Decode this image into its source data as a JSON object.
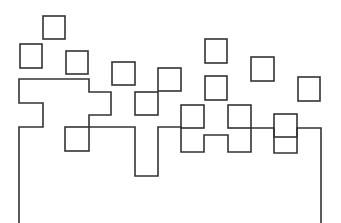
{
  "diagram": {
    "width": 341,
    "height": 223,
    "background": "#ffffff",
    "stroke_color": "#333333",
    "stroke_width": 1.6,
    "outline_path": [
      [
        19,
        223
      ],
      [
        19,
        127
      ],
      [
        43,
        127
      ],
      [
        43,
        103
      ],
      [
        19,
        103
      ],
      [
        19,
        79
      ],
      [
        89,
        79
      ],
      [
        89,
        92
      ],
      [
        111,
        92
      ],
      [
        111,
        115
      ],
      [
        89,
        115
      ],
      [
        89,
        127
      ],
      [
        135,
        127
      ],
      [
        135,
        176
      ],
      [
        158,
        176
      ],
      [
        158,
        127
      ],
      [
        181,
        127
      ],
      [
        181,
        152
      ],
      [
        204,
        152
      ],
      [
        204,
        135
      ],
      [
        228,
        135
      ],
      [
        228,
        152
      ],
      [
        251,
        152
      ],
      [
        251,
        128
      ],
      [
        274,
        128
      ],
      [
        274,
        153
      ],
      [
        297,
        153
      ],
      [
        297,
        128
      ],
      [
        321,
        128
      ],
      [
        321,
        223
      ]
    ],
    "squares": [
      {
        "x": 43,
        "y": 16,
        "w": 22,
        "h": 23
      },
      {
        "x": 20,
        "y": 44,
        "w": 22,
        "h": 24
      },
      {
        "x": 66,
        "y": 51,
        "w": 22,
        "h": 23
      },
      {
        "x": 112,
        "y": 62,
        "w": 23,
        "h": 23
      },
      {
        "x": 158,
        "y": 68,
        "w": 23,
        "h": 23
      },
      {
        "x": 135,
        "y": 92,
        "w": 23,
        "h": 23
      },
      {
        "x": 65,
        "y": 127,
        "w": 24,
        "h": 24
      },
      {
        "x": 205,
        "y": 39,
        "w": 22,
        "h": 24
      },
      {
        "x": 251,
        "y": 57,
        "w": 23,
        "h": 24
      },
      {
        "x": 205,
        "y": 76,
        "w": 22,
        "h": 24
      },
      {
        "x": 298,
        "y": 77,
        "w": 22,
        "h": 24
      },
      {
        "x": 181,
        "y": 105,
        "w": 23,
        "h": 23
      },
      {
        "x": 228,
        "y": 105,
        "w": 23,
        "h": 23
      },
      {
        "x": 274,
        "y": 114,
        "w": 23,
        "h": 23
      }
    ]
  }
}
